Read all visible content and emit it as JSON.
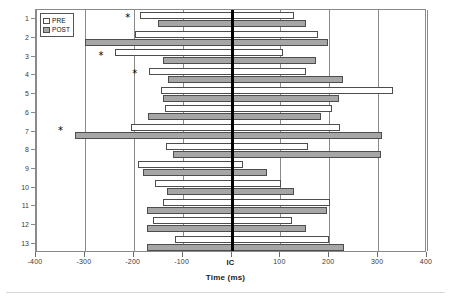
{
  "chart_data": {
    "type": "bar",
    "orientation": "horizontal",
    "title": "",
    "xlabel": "Time (ms)",
    "ylabel": "",
    "xlim": [
      -400,
      400
    ],
    "xticks": [
      -400,
      -300,
      -200,
      -100,
      0,
      100,
      200,
      300,
      400
    ],
    "xtick_labels": [
      "-400",
      "-300",
      "-200",
      "-100",
      "IC",
      "100",
      "200",
      "300",
      "400"
    ],
    "categories": [
      "1",
      "2",
      "3",
      "4",
      "5",
      "6",
      "7",
      "8",
      "9",
      "10",
      "11",
      "12",
      "13"
    ],
    "grid": "vertical",
    "zero_reference": {
      "value": 0,
      "label": "IC",
      "color": "#000000"
    },
    "legend": {
      "position": "top-left",
      "entries": [
        {
          "name": "PRE",
          "color": "#ffffff",
          "edge": "#4d4d4d"
        },
        {
          "name": "POST",
          "color": "#a6a6a6",
          "edge": "#4d4d4d"
        }
      ]
    },
    "series": [
      {
        "name": "PRE",
        "color": "#ffffff",
        "ranges": [
          {
            "category": "1",
            "start": -187,
            "end": 127
          },
          {
            "category": "2",
            "start": -197,
            "end": 176
          },
          {
            "category": "3",
            "start": -238,
            "end": 106
          },
          {
            "category": "4",
            "start": -169,
            "end": 152
          },
          {
            "category": "5",
            "start": -144,
            "end": 330
          },
          {
            "category": "6",
            "start": -136,
            "end": 206
          },
          {
            "category": "7",
            "start": -206,
            "end": 221
          },
          {
            "category": "8",
            "start": -133,
            "end": 156
          },
          {
            "category": "9",
            "start": -192,
            "end": 23
          },
          {
            "category": "10",
            "start": -156,
            "end": 102
          },
          {
            "category": "11",
            "start": -140,
            "end": 202
          },
          {
            "category": "12",
            "start": -160,
            "end": 123
          },
          {
            "category": "13",
            "start": -116,
            "end": 200
          }
        ]
      },
      {
        "name": "POST",
        "color": "#a6a6a6",
        "ranges": [
          {
            "category": "1",
            "start": -150,
            "end": 152
          },
          {
            "category": "2",
            "start": -300,
            "end": 198
          },
          {
            "category": "3",
            "start": -140,
            "end": 173
          },
          {
            "category": "4",
            "start": -129,
            "end": 229
          },
          {
            "category": "5",
            "start": -140,
            "end": 219
          },
          {
            "category": "6",
            "start": -171,
            "end": 183
          },
          {
            "category": "7",
            "start": -321,
            "end": 308
          },
          {
            "category": "8",
            "start": -119,
            "end": 306
          },
          {
            "category": "9",
            "start": -181,
            "end": 73
          },
          {
            "category": "10",
            "start": -131,
            "end": 127
          },
          {
            "category": "11",
            "start": -173,
            "end": 196
          },
          {
            "category": "12",
            "start": -173,
            "end": 152
          },
          {
            "category": "13",
            "start": -173,
            "end": 231
          }
        ]
      }
    ],
    "annotations": [
      {
        "symbol": "*",
        "category": "1",
        "x": -210,
        "meaning": "significant"
      },
      {
        "symbol": "*",
        "category": "3",
        "x": -265,
        "meaning": "significant"
      },
      {
        "symbol": "*",
        "category": "4",
        "x": -196,
        "meaning": "significant"
      },
      {
        "symbol": "*",
        "category": "7",
        "x": -348,
        "meaning": "significant"
      }
    ]
  }
}
